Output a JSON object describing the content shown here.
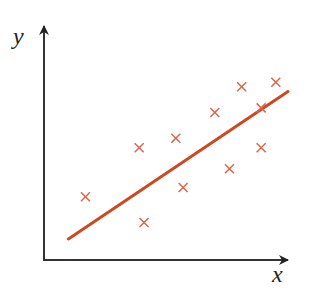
{
  "chart_data": {
    "type": "scatter",
    "title": "",
    "xlabel": "x",
    "ylabel": "y",
    "grid": false,
    "legend": null,
    "ticks": {
      "x": [],
      "y": []
    },
    "xlim": [
      0,
      10
    ],
    "ylim": [
      0,
      10
    ],
    "series": [
      {
        "name": "data points",
        "marker": "x",
        "color": "#d9664a",
        "points": [
          {
            "x": 1.7,
            "y": 2.7
          },
          {
            "x": 3.9,
            "y": 4.8
          },
          {
            "x": 4.1,
            "y": 1.6
          },
          {
            "x": 5.4,
            "y": 5.2
          },
          {
            "x": 5.7,
            "y": 3.1
          },
          {
            "x": 7.0,
            "y": 6.3
          },
          {
            "x": 7.6,
            "y": 3.9
          },
          {
            "x": 8.1,
            "y": 7.4
          },
          {
            "x": 8.9,
            "y": 4.8
          },
          {
            "x": 8.9,
            "y": 6.5
          },
          {
            "x": 9.5,
            "y": 7.6
          }
        ]
      },
      {
        "name": "regression line",
        "type": "line",
        "color": "#cc4a22",
        "points": [
          {
            "x": 1.0,
            "y": 0.9
          },
          {
            "x": 10.0,
            "y": 7.2
          }
        ]
      }
    ]
  },
  "render": {
    "origin_px": [
      44,
      260
    ],
    "x_axis_end_px": 288,
    "y_axis_end_px": 26,
    "x_scale_px": 24.4,
    "y_scale_px": 23.4,
    "axis_color": "#333333",
    "marker_color": "#d9664a",
    "line_color": "#cc4a22",
    "labels": {
      "x": "x",
      "y": "y"
    }
  }
}
